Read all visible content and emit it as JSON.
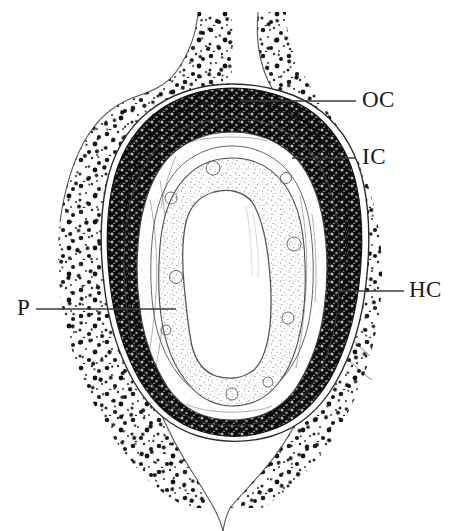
{
  "figure": {
    "kind": "histology-cross-section",
    "background_color": "#ffffff",
    "ink_color": "#1a1a1a",
    "width": 465,
    "height": 531
  },
  "labels": [
    {
      "id": "oc",
      "text": "OC",
      "text_x": 362,
      "text_y": 90,
      "leader": {
        "x1": 240,
        "y1": 101,
        "x2": 356,
        "y2": 101
      },
      "meaning": "outer capsule"
    },
    {
      "id": "ic",
      "text": "IC",
      "text_x": 362,
      "text_y": 146,
      "leader": {
        "x1": 292,
        "y1": 158,
        "x2": 356,
        "y2": 158
      },
      "meaning": "inner capsule"
    },
    {
      "id": "hc",
      "text": "HC",
      "text_x": 410,
      "text_y": 280,
      "leader": {
        "x1": 337,
        "y1": 291,
        "x2": 404,
        "y2": 291
      },
      "meaning": "host connective tissue"
    },
    {
      "id": "p",
      "text": "P",
      "text_x": 18,
      "text_y": 297,
      "leader": {
        "x1": 36,
        "y1": 309,
        "x2": 176,
        "y2": 309
      },
      "meaning": "pigment layer"
    }
  ],
  "structures": [
    {
      "id": "host-tissue",
      "name": "stippled host tissue"
    },
    {
      "id": "outer-capsule",
      "name": "outer capsule band"
    },
    {
      "id": "pigment-layer",
      "name": "dark pigment layer"
    },
    {
      "id": "inner-capsule",
      "name": "inner capsule layers"
    },
    {
      "id": "granulosa",
      "name": "stippled granulosa zone"
    },
    {
      "id": "lumen",
      "name": "central lumen"
    }
  ]
}
